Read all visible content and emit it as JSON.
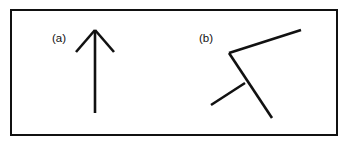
{
  "figure": {
    "background_color": "#ffffff",
    "ink_color": "#111111",
    "frame": {
      "name": "figure-border",
      "x": 11,
      "y": 10,
      "width": 326,
      "height": 125,
      "stroke_width": 2
    },
    "panels": [
      {
        "id": "a",
        "label": "(a)",
        "label_x": 52,
        "label_y": 42,
        "description": "upward-pointing arrow",
        "strokes": [
          {
            "name": "arrow-shaft",
            "x1": 95,
            "y1": 30,
            "x2": 95,
            "y2": 113
          },
          {
            "name": "arrow-barb-left",
            "x1": 95,
            "y1": 30,
            "x2": 76,
            "y2": 52
          },
          {
            "name": "arrow-barb-right",
            "x1": 95,
            "y1": 30,
            "x2": 114,
            "y2": 52
          }
        ]
      },
      {
        "id": "b",
        "label": "(b)",
        "label_x": 199,
        "label_y": 42,
        "description": "same arrow rotated and sheared",
        "strokes": [
          {
            "name": "arrow-shaft",
            "x1": 229,
            "y1": 53,
            "x2": 272,
            "y2": 118
          },
          {
            "name": "arrow-barb-upper-right",
            "x1": 229,
            "y1": 53,
            "x2": 301,
            "y2": 30
          },
          {
            "name": "arrow-barb-lower-left",
            "x1": 245,
            "y1": 83,
            "x2": 211,
            "y2": 105
          }
        ]
      }
    ]
  }
}
